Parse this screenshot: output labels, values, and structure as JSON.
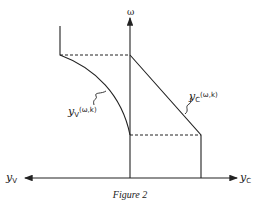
{
  "figure": {
    "caption": "Figure 2",
    "axes": {
      "vertical_label": "ω",
      "left_label_main": "y",
      "left_label_sub": "V",
      "right_label_main": "y",
      "right_label_sub": "C"
    },
    "curves": {
      "yv_main": "y",
      "yv_sub": "V",
      "yv_args": "(ω,k)",
      "yc_main": "y",
      "yc_sub": "C",
      "yc_args": "(ω,k)"
    }
  }
}
